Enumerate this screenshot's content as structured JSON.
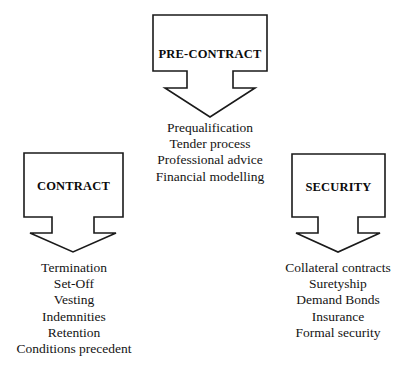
{
  "diagram": {
    "type": "flow-diagram",
    "background_color": "#ffffff",
    "stroke_color": "#1a1a1a",
    "text_color": "#111111",
    "nodes": [
      {
        "id": "pre-contract",
        "label": "PRE-CONTRACT",
        "arrow": "down-arrow",
        "items": [
          "Prequalification",
          "Tender process",
          "Professional advice",
          "Financial modelling"
        ]
      },
      {
        "id": "contract",
        "label": "CONTRACT",
        "arrow": "down-arrow",
        "items": [
          "Termination",
          "Set-Off",
          "Vesting",
          "Indemnities",
          "Retention",
          "Conditions precedent"
        ]
      },
      {
        "id": "security",
        "label": "SECURITY",
        "arrow": "down-arrow",
        "items": [
          "Collateral contracts",
          "Suretyship",
          "Demand Bonds",
          "Insurance",
          "Formal security"
        ]
      }
    ]
  }
}
